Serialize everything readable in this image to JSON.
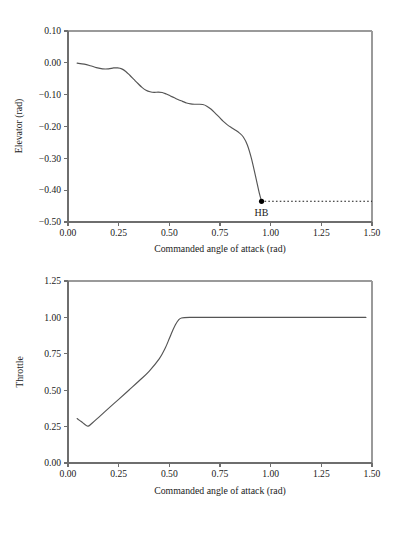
{
  "figure": {
    "panels": [
      "elevator-panel",
      "throttle-panel"
    ]
  },
  "chart_data": [
    {
      "type": "line",
      "id": "elevator-panel",
      "title": "",
      "xlabel": "Commanded angle of attack (rad)",
      "ylabel": "Elevator (rad)",
      "xlim": [
        0.0,
        1.5
      ],
      "ylim": [
        -0.5,
        0.1
      ],
      "xticks": [
        0.0,
        0.25,
        0.5,
        0.75,
        1.0,
        1.25,
        1.5
      ],
      "xticklabels": [
        "0.00",
        "0.25",
        "0.50",
        "0.75",
        "1.00",
        "1.25",
        "1.50"
      ],
      "yticks": [
        -0.5,
        -0.4,
        -0.3,
        -0.2,
        -0.1,
        0.0,
        0.1
      ],
      "yticklabels": [
        "-0.50",
        "-0.40",
        "-0.30",
        "-0.20",
        "-0.10",
        "0.00",
        "0.10"
      ],
      "grid": false,
      "legend": "none",
      "series": [
        {
          "name": "elevator",
          "x": [
            0.045,
            0.08,
            0.11,
            0.14,
            0.17,
            0.2,
            0.225,
            0.245,
            0.265,
            0.285,
            0.305,
            0.325,
            0.345,
            0.365,
            0.385,
            0.405,
            0.425,
            0.445,
            0.465,
            0.485,
            0.505,
            0.525,
            0.545,
            0.565,
            0.585,
            0.605,
            0.625,
            0.645,
            0.665,
            0.685,
            0.705,
            0.725,
            0.745,
            0.765,
            0.785,
            0.805,
            0.825,
            0.845,
            0.865,
            0.885,
            0.905,
            0.925,
            0.945,
            0.955
          ],
          "y": [
            -0.001,
            -0.004,
            -0.009,
            -0.015,
            -0.019,
            -0.019,
            -0.016,
            -0.016,
            -0.019,
            -0.027,
            -0.039,
            -0.052,
            -0.065,
            -0.077,
            -0.086,
            -0.091,
            -0.093,
            -0.092,
            -0.093,
            -0.098,
            -0.104,
            -0.11,
            -0.116,
            -0.121,
            -0.126,
            -0.129,
            -0.13,
            -0.13,
            -0.131,
            -0.136,
            -0.145,
            -0.157,
            -0.17,
            -0.183,
            -0.194,
            -0.203,
            -0.211,
            -0.22,
            -0.233,
            -0.258,
            -0.3,
            -0.355,
            -0.412,
            -0.435
          ]
        }
      ],
      "annotations": [
        {
          "label": "HB",
          "x": 0.955,
          "y": -0.435,
          "marker": "filled-circle",
          "leader": {
            "style": "dotted",
            "from_x": 0.955,
            "to_x": 1.5,
            "y": -0.435
          }
        }
      ]
    },
    {
      "type": "line",
      "id": "throttle-panel",
      "title": "",
      "xlabel": "Commanded angle of attack (rad)",
      "ylabel": "Throttle",
      "xlim": [
        0.0,
        1.5
      ],
      "ylim": [
        0.0,
        1.25
      ],
      "xticks": [
        0.0,
        0.25,
        0.5,
        0.75,
        1.0,
        1.25,
        1.5
      ],
      "xticklabels": [
        "0.00",
        "0.25",
        "0.50",
        "0.75",
        "1.00",
        "1.25",
        "1.50"
      ],
      "yticks": [
        0.0,
        0.25,
        0.5,
        0.75,
        1.0,
        1.25
      ],
      "yticklabels": [
        "0.00",
        "0.25",
        "0.50",
        "0.75",
        "1.00",
        "1.25"
      ],
      "grid": false,
      "legend": "none",
      "series": [
        {
          "name": "throttle",
          "x": [
            0.045,
            0.065,
            0.085,
            0.1,
            0.12,
            0.15,
            0.2,
            0.25,
            0.3,
            0.35,
            0.4,
            0.45,
            0.48,
            0.5,
            0.515,
            0.53,
            0.545,
            0.56,
            0.6,
            0.7,
            0.85,
            1.0,
            1.2,
            1.47
          ],
          "y": [
            0.305,
            0.285,
            0.263,
            0.253,
            0.275,
            0.312,
            0.375,
            0.437,
            0.5,
            0.563,
            0.63,
            0.715,
            0.79,
            0.855,
            0.905,
            0.95,
            0.982,
            0.996,
            1.0,
            1.0,
            1.0,
            1.0,
            1.0,
            1.0
          ]
        }
      ],
      "annotations": []
    }
  ]
}
